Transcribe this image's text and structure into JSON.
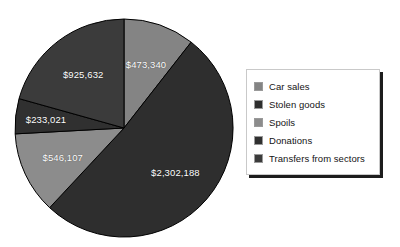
{
  "chart_data": {
    "type": "pie",
    "title": "",
    "subtitle": "",
    "xlabel": "",
    "ylabel": "",
    "grid": false,
    "legend_position": "right",
    "start_angle_deg": 0,
    "direction": "clockwise",
    "total": 4480288,
    "currency_symbol": "$",
    "categories": [
      "Car sales",
      "Stolen goods",
      "Spoils",
      "Donations",
      "Transfers from sectors"
    ],
    "values": [
      473340,
      2302188,
      546107,
      233021,
      925632
    ],
    "value_labels": [
      "$473,340",
      "$2,302,188",
      "$546,107",
      "$233,021",
      "$925,632"
    ],
    "percentages": [
      10.57,
      51.39,
      12.19,
      5.2,
      20.66
    ],
    "angles_deg": [
      38.04,
      185.0,
      43.88,
      18.73,
      74.38
    ],
    "colors": [
      "#848484",
      "#2e2e2e",
      "#8c8c8c",
      "#303030",
      "#3b3b3b"
    ],
    "slice_border_color": "#000000",
    "label_color": "#ffffff",
    "slices": [
      {
        "name": "Car sales",
        "value": 473340,
        "label": "$473,340",
        "percent": 10.57,
        "color": "#848484",
        "start_deg": 0,
        "end_deg": 38.04
      },
      {
        "name": "Stolen goods",
        "value": 2302188,
        "label": "$2,302,188",
        "percent": 51.39,
        "color": "#2e2e2e",
        "start_deg": 38.04,
        "end_deg": 223.04
      },
      {
        "name": "Spoils",
        "value": 546107,
        "label": "$546,107",
        "percent": 12.19,
        "color": "#8c8c8c",
        "start_deg": 223.04,
        "end_deg": 266.92
      },
      {
        "name": "Donations",
        "value": 233021,
        "label": "$233,021",
        "percent": 5.2,
        "color": "#303030",
        "start_deg": 266.92,
        "end_deg": 285.65
      },
      {
        "name": "Transfers from sectors",
        "value": 925632,
        "label": "$925,632",
        "percent": 20.66,
        "color": "#3b3b3b",
        "start_deg": 285.65,
        "end_deg": 360
      }
    ]
  },
  "legend": {
    "items": [
      {
        "label": "Car sales",
        "color": "#848484"
      },
      {
        "label": "Stolen goods",
        "color": "#2e2e2e"
      },
      {
        "label": "Spoils",
        "color": "#8c8c8c"
      },
      {
        "label": "Donations",
        "color": "#303030"
      },
      {
        "label": "Transfers from sectors",
        "color": "#3b3b3b"
      }
    ]
  },
  "labels": {
    "car_sales": "$473,340",
    "stolen_goods": "$2,302,188",
    "spoils": "$546,107",
    "donations": "$233,021",
    "transfers": "$925,632"
  },
  "geometry": {
    "center_x": 124,
    "center_y": 128,
    "radius": 109
  }
}
